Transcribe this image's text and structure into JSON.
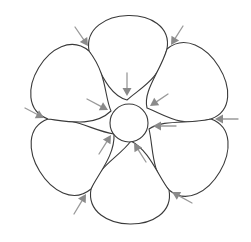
{
  "diagram": {
    "center": [
      129,
      123
    ],
    "hub_radius": 19,
    "petal_count": 6,
    "rotation_step_deg": 60,
    "colors": {
      "outline": "#3a3a3a",
      "arrow": "#8a8a8a",
      "arrow_shaft": "#9a9a9a",
      "background": "#ffffff"
    },
    "outer_junctions": [
      [
        89,
        51
      ],
      [
        167,
        49
      ],
      [
        211,
        119
      ],
      [
        169,
        190
      ],
      [
        91,
        189
      ],
      [
        48,
        119
      ]
    ],
    "inner_junctions": [
      [
        127,
        100
      ],
      [
        147,
        108
      ],
      [
        149,
        129
      ],
      [
        131,
        141
      ],
      [
        114,
        134
      ],
      [
        111,
        111
      ]
    ],
    "outer_arrows": [
      {
        "from": [
          75,
          27
        ],
        "to": [
          88,
          46
        ]
      },
      {
        "from": [
          183,
          26
        ],
        "to": [
          171,
          45
        ]
      },
      {
        "from": [
          238,
          119
        ],
        "to": [
          215,
          119
        ]
      },
      {
        "from": [
          192,
          203
        ],
        "to": [
          172,
          192
        ]
      },
      {
        "from": [
          74,
          214
        ],
        "to": [
          86,
          194
        ]
      },
      {
        "from": [
          25,
          108
        ],
        "to": [
          44,
          118
        ]
      }
    ],
    "inner_arrows": [
      {
        "from": [
          127,
          73
        ],
        "to": [
          127,
          96
        ]
      },
      {
        "from": [
          168,
          94
        ],
        "to": [
          150,
          106
        ]
      },
      {
        "from": [
          176,
          126
        ],
        "to": [
          153,
          126
        ]
      },
      {
        "from": [
          146,
          162
        ],
        "to": [
          134,
          143
        ]
      },
      {
        "from": [
          99,
          154
        ],
        "to": [
          111,
          135
        ]
      },
      {
        "from": [
          87,
          99
        ],
        "to": [
          108,
          110
        ]
      }
    ]
  }
}
